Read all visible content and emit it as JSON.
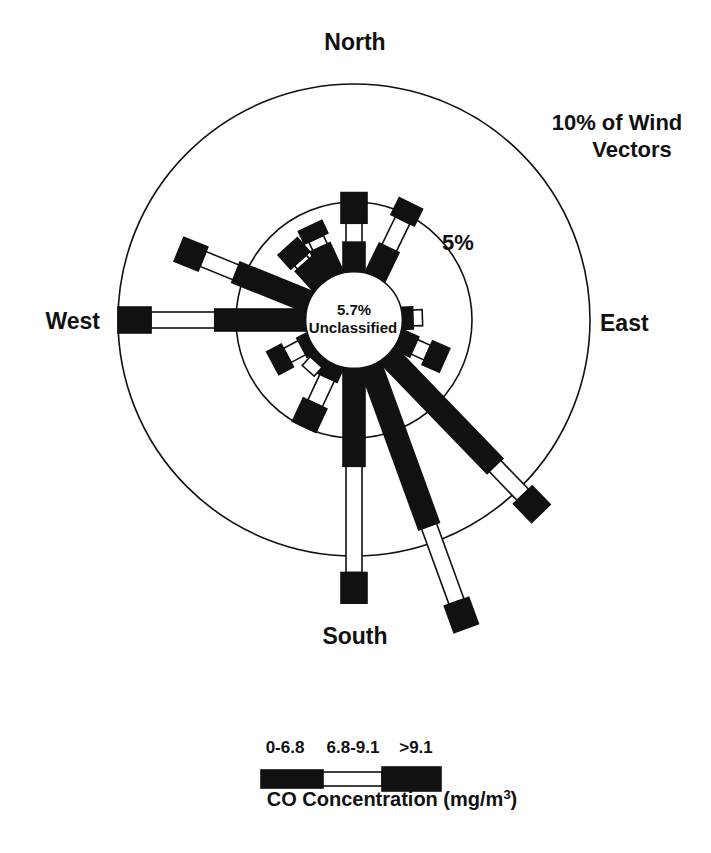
{
  "chart_data": {
    "type": "wind-rose",
    "title": "",
    "direction_labels": {
      "north": "North",
      "east": "East",
      "south": "South",
      "west": "West"
    },
    "rings": [
      {
        "value": 5,
        "label": "5%"
      },
      {
        "value": 10,
        "label": "10% of Wind Vectors",
        "label_lines": [
          "10% of Wind",
          "Vectors"
        ]
      }
    ],
    "center": {
      "value_label": "5.7%",
      "text": "Unclassified",
      "radius_pct": 2.05
    },
    "units": "% of wind vectors (radial, measured from plot center)",
    "classes": [
      {
        "name": "0-6.8",
        "fill": "#111111"
      },
      {
        "name": "6.8-9.1",
        "fill": "#ffffff"
      },
      {
        "name": ">9.1",
        "fill": "#111111"
      }
    ],
    "series": [
      {
        "direction": "N",
        "angle_deg": 0,
        "cumulative_pct": [
          3.3,
          4.1,
          5.4
        ]
      },
      {
        "direction": "NNE",
        "angle_deg": 26,
        "cumulative_pct": [
          3.4,
          4.7,
          5.5
        ]
      },
      {
        "direction": "E",
        "angle_deg": 88,
        "cumulative_pct": [
          2.5,
          2.9,
          2.9
        ]
      },
      {
        "direction": "ESE",
        "angle_deg": 114,
        "cumulative_pct": [
          2.8,
          3.4,
          4.2
        ]
      },
      {
        "direction": "SE",
        "angle_deg": 136,
        "cumulative_pct": [
          8.6,
          10.3,
          11.4
        ]
      },
      {
        "direction": "SSE",
        "angle_deg": 160,
        "cumulative_pct": [
          9.3,
          12.7,
          13.9
        ]
      },
      {
        "direction": "S",
        "angle_deg": 180,
        "cumulative_pct": [
          6.2,
          10.7,
          12.0
        ]
      },
      {
        "direction": "SSW",
        "angle_deg": 205,
        "cumulative_pct": [
          2.7,
          3.9,
          5.0
        ]
      },
      {
        "direction": "SW",
        "angle_deg": 222,
        "cumulative_pct": [
          2.4,
          2.9,
          2.9
        ]
      },
      {
        "direction": "WSW",
        "angle_deg": 242,
        "cumulative_pct": [
          2.5,
          3.2,
          3.9
        ]
      },
      {
        "direction": "W",
        "angle_deg": 270,
        "cumulative_pct": [
          5.9,
          8.6,
          10.0
        ]
      },
      {
        "direction": "WNW",
        "angle_deg": 292,
        "cumulative_pct": [
          5.4,
          6.9,
          8.0
        ]
      },
      {
        "direction": "NW",
        "angle_deg": 318,
        "cumulative_pct": [
          3.2,
          3.4,
          4.2
        ]
      },
      {
        "direction": "NNW",
        "angle_deg": 335,
        "cumulative_pct": [
          3.4,
          3.8,
          4.4
        ]
      }
    ],
    "legend": {
      "labels": [
        "0-6.8",
        "6.8-9.1",
        ">9.1"
      ],
      "title": "CO Concentration (mg/m",
      "title_sup": "3",
      "title_end": ")",
      "placement": "bottom-center"
    }
  }
}
